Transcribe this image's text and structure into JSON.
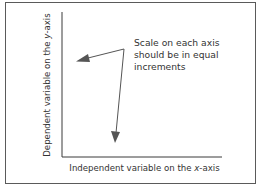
{
  "diagram": {
    "type": "annotated-graph-axes",
    "annotation": {
      "lines": [
        "Scale on each axis",
        "should be in equal",
        "increments"
      ]
    },
    "x_axis": {
      "label_prefix": "Independent variable on the ",
      "label_var": "x",
      "label_suffix": "-axis"
    },
    "y_axis": {
      "label_prefix": "Dependent variable on the ",
      "label_var": "y",
      "label_suffix": "-axis"
    },
    "arrows": [
      {
        "name": "arrow-to-y-axis",
        "from": [
          124,
          49
        ],
        "to": [
          77,
          61
        ]
      },
      {
        "name": "arrow-to-x-axis",
        "from": [
          124,
          49
        ],
        "to": [
          115,
          142
        ]
      }
    ],
    "colors": {
      "axis": "#3a3a3a",
      "arrow": "#555555",
      "text": "#333333",
      "frame": "#5a5a5a"
    }
  }
}
